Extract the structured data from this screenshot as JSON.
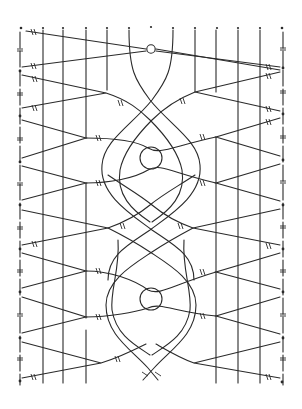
{
  "diagram": {
    "title": "",
    "type": "bobbin lace pricking / working diagram",
    "colors": {
      "background": "#ffffff",
      "ink": "#2a2a2a"
    },
    "top_pins_x": [
      21,
      43,
      63,
      86,
      107,
      129,
      151,
      173,
      195,
      217,
      238,
      260,
      282
    ],
    "start_marker": {
      "shape": "circle",
      "x": 151,
      "y": 33
    },
    "left_edge_x": 20,
    "right_edge_x": 283,
    "left_passives_x": [
      43,
      63,
      86
    ],
    "right_passives_x": [
      216,
      238,
      260
    ],
    "left_edge_pins_y": [
      28,
      71,
      116,
      162,
      205,
      249,
      292,
      338,
      381
    ],
    "right_edge_pins_y": [
      28,
      68,
      114,
      160,
      205,
      249,
      292,
      338,
      382
    ],
    "center_rings": [
      {
        "cx": 151,
        "cy": 158,
        "r": 11
      },
      {
        "cx": 151,
        "cy": 299,
        "r": 11
      }
    ],
    "twist_mark": "≠"
  }
}
